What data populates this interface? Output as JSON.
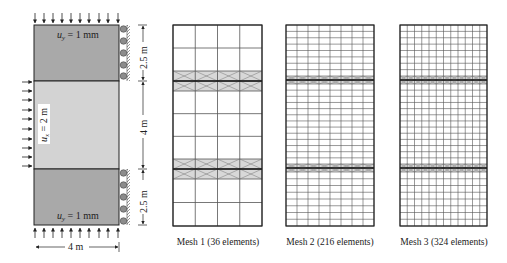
{
  "problem": {
    "top_block_label": "u_y = 1 mm",
    "top_block_label_var": "u",
    "top_block_label_sub": "y",
    "top_block_label_rest": " = 1 mm",
    "bottom_block_label_var": "u",
    "bottom_block_label_sub": "y",
    "bottom_block_label_rest": " = 1 mm",
    "middle_label_var": "u",
    "middle_label_sub": "x",
    "middle_label_rest": " = 2 m",
    "dim_top": "2.5 m",
    "dim_middle": "4 m",
    "dim_bottom": "2.5 m",
    "dim_width": "4 m",
    "colors": {
      "outer_block": "#a9a9a9",
      "middle_block": "#d3d3d3",
      "roller": "#8c8c8c",
      "line": "#222222"
    }
  },
  "meshes": [
    {
      "caption": "Mesh 1 (36 elements)",
      "cols": 4,
      "rows_top": 2,
      "rows_mid": 3,
      "rows_bot": 2,
      "interface_rows": 2
    },
    {
      "caption": "Mesh 2 (216 elements)",
      "cols": 8,
      "rows_top": 8,
      "rows_mid": 13,
      "rows_bot": 8,
      "interface_rows": 2
    },
    {
      "caption": "Mesh 3 (324 elements)",
      "cols": 12,
      "rows_top": 8,
      "rows_mid": 13,
      "rows_bot": 8,
      "interface_rows": 2
    }
  ]
}
